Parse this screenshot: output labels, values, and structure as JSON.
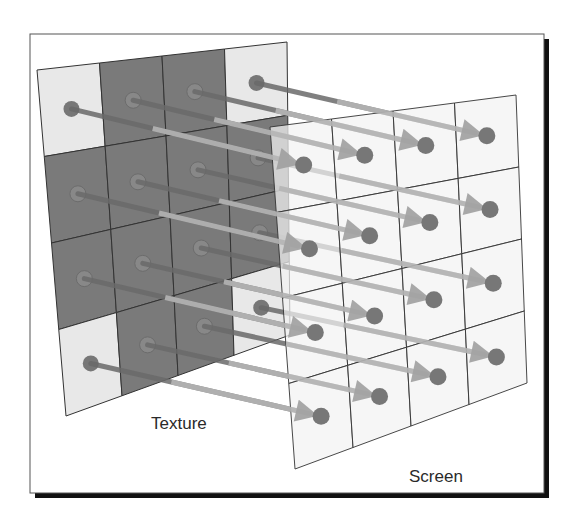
{
  "figure": {
    "labels": {
      "texture": "Texture",
      "screen": "Screen"
    },
    "grid_size": 4,
    "frame": {
      "x": 30,
      "y": 34,
      "width": 514,
      "height": 459,
      "shadow_offset": 5
    },
    "texture": {
      "corners": {
        "tl": [
          37,
          70
        ],
        "tr": [
          287,
          42
        ],
        "br": [
          290,
          335
        ],
        "bl": [
          66,
          416
        ]
      },
      "cell_pattern": [
        [
          "light",
          "dark",
          "dark",
          "light"
        ],
        [
          "dark",
          "dark",
          "dark",
          "dark"
        ],
        [
          "dark",
          "dark",
          "dark",
          "dark"
        ],
        [
          "light",
          "dark",
          "dark",
          "light"
        ]
      ]
    },
    "screen": {
      "corners": {
        "tl": [
          270,
          127
        ],
        "tr": [
          516,
          95
        ],
        "br": [
          527,
          383
        ],
        "bl": [
          295,
          469
        ]
      }
    },
    "colors": {
      "light_cell": "#e8e8e8",
      "dark_cell": "#7a7a7a",
      "grid_line": "#333333",
      "screen_fill": "#f2f2f2",
      "dot_fill": "#777777",
      "arrow": "#6a6a6a",
      "arrowhead": "#a0a0a0",
      "frame_border": "#555555",
      "frame_shadow": "#111111"
    }
  }
}
